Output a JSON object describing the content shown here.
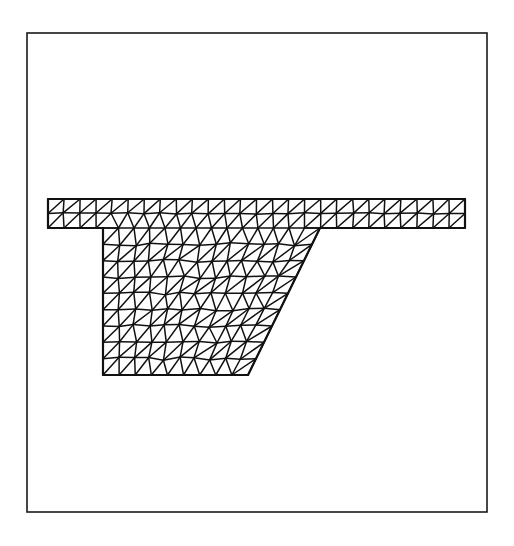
{
  "figure": {
    "kind": "mesh-diagram",
    "background_color": "#ffffff",
    "line_color": "#111111",
    "canvas": {
      "width": 514,
      "height": 546
    }
  },
  "frame": {
    "name": "outer-border",
    "x": 27,
    "y": 33,
    "width": 460,
    "height": 479,
    "stroke_color": "#1a1a1a",
    "stroke_width": 1.6,
    "fill": "none"
  },
  "mesh": {
    "stroke_color": "#111111",
    "edge_stroke_width": 1.5,
    "boundary_stroke_width": 2.2,
    "element_type": "triangle",
    "nominal_spacing_px": 16,
    "regions": [
      {
        "name": "top-flange",
        "description": "Horizontal slab spanning the full width, two element rows deep",
        "x_left": 48,
        "x_right": 465,
        "y_top": 199,
        "y_bottom": 228,
        "rows": 2
      },
      {
        "name": "web",
        "description": "Trapezoidal stem below the flange, vertical on the left and sloped on the right",
        "y_top": 228,
        "y_bottom": 375,
        "x_left": 103,
        "x_right_top": 320,
        "x_right_bottom": 248,
        "rows": 9
      }
    ],
    "outline_points": [
      [
        48,
        199
      ],
      [
        465,
        199
      ],
      [
        465,
        228
      ],
      [
        320,
        228
      ],
      [
        248,
        375
      ],
      [
        103,
        375
      ],
      [
        103,
        228
      ],
      [
        48,
        228
      ]
    ]
  },
  "labels": {
    "axis_labels": [],
    "tick_labels": [],
    "legend_entries": [],
    "annotations": []
  }
}
